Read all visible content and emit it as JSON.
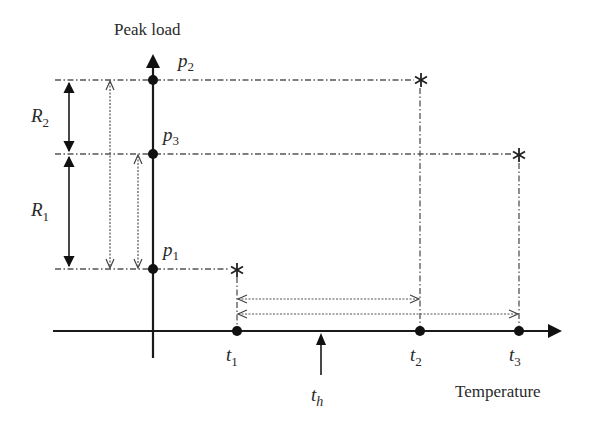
{
  "diagram": {
    "y_axis_label": "Peak load",
    "x_axis_label": "Temperature",
    "load_points": [
      {
        "name": "p",
        "sub": "2"
      },
      {
        "name": "p",
        "sub": "3"
      },
      {
        "name": "p",
        "sub": "1"
      }
    ],
    "ranges": [
      {
        "name": "R",
        "sub": "2"
      },
      {
        "name": "R",
        "sub": "1"
      }
    ],
    "temperatures": [
      {
        "name": "t",
        "sub": "1"
      },
      {
        "name": "t",
        "sub": "2"
      },
      {
        "name": "t",
        "sub": "3"
      },
      {
        "name": "t",
        "sub": "h"
      }
    ],
    "markers": {
      "peak_marker": "*"
    },
    "colors": {
      "line": "#1a1a1a",
      "guide": "#555555",
      "background": "#ffffff"
    }
  }
}
